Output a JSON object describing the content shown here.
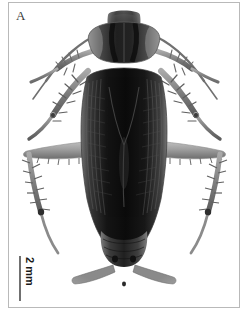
{
  "figure": {
    "panel_label": "A",
    "background_color": "#ffffff",
    "frame_color": "#b9b9b9",
    "caption_font_color": "#3a3a3a"
  },
  "scale_bar": {
    "label": "2 mm",
    "orientation": "vertical",
    "bar_color": "#707070",
    "label_color": "#1a1a1a"
  },
  "specimen": {
    "subject": "cockroach",
    "view": "dorsal",
    "rendering": "grayscale-photograph",
    "body_color": "#2b2b2b",
    "wing_color": "#1c1c1c",
    "leg_color": "#8d8d8d",
    "highlight_color": "#d8d8d8",
    "parts": [
      "antenna-left",
      "antenna-right",
      "head",
      "pronotum",
      "tegmina",
      "abdomen",
      "cercus-left",
      "cercus-right",
      "foreleg-left",
      "foreleg-right",
      "midleg-left",
      "midleg-right",
      "hindleg-left",
      "hindleg-right"
    ]
  }
}
